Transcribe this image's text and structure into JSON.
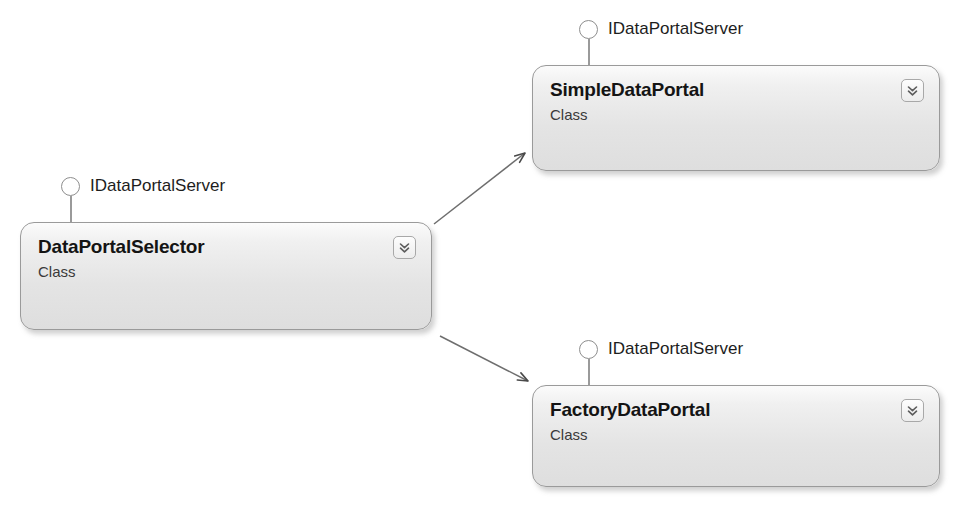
{
  "diagram": {
    "type": "uml-class-diagram",
    "background_color": "#ffffff",
    "border_color": "#9a9a9a",
    "connector_color": "#5a5a5a"
  },
  "classes": [
    {
      "id": "data-portal-selector",
      "name": "DataPortalSelector",
      "stereotype": "Class",
      "interface": "IDataPortalServer",
      "expander_icon": "chevron-double-down-icon"
    },
    {
      "id": "simple-data-portal",
      "name": "SimpleDataPortal",
      "stereotype": "Class",
      "interface": "IDataPortalServer",
      "expander_icon": "chevron-double-down-icon"
    },
    {
      "id": "factory-data-portal",
      "name": "FactoryDataPortal",
      "stereotype": "Class",
      "interface": "IDataPortalServer",
      "expander_icon": "chevron-double-down-icon"
    }
  ],
  "connectors": [
    {
      "id": "selector-to-simple",
      "from": "DataPortalSelector",
      "to": "SimpleDataPortal",
      "arrowhead": "open"
    },
    {
      "id": "selector-to-factory",
      "from": "DataPortalSelector",
      "to": "FactoryDataPortal",
      "arrowhead": "open"
    }
  ]
}
